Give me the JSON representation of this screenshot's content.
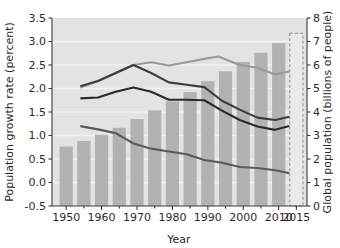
{
  "chart_data": {
    "type": "bar",
    "title": "",
    "subtitle": "",
    "xlabel": "Year",
    "ylabel": "Population growth rate (percent)",
    "y2label": "Global population (billions of people)",
    "xlim": [
      1946,
      2018
    ],
    "ylim": [
      -0.5,
      3.5
    ],
    "y2lim": [
      0,
      8
    ],
    "grid": true,
    "legend": "none",
    "xticks": [
      1950,
      1960,
      1970,
      1980,
      1990,
      2000,
      2010,
      2015
    ],
    "xticklabels": [
      "1950",
      "1960",
      "1970",
      "1980",
      "1990",
      "2000",
      "2010",
      "2015"
    ],
    "xminorticks": [
      1955,
      1965,
      1975,
      1985,
      1995,
      2005
    ],
    "yticks": [
      -0.5,
      0.0,
      0.5,
      1.0,
      1.5,
      2.0,
      2.5,
      3.0,
      3.5
    ],
    "yticklabels": [
      "-0.5",
      "0.0",
      "0.5",
      "1.0",
      "1.5",
      "2.0",
      "2.5",
      "3.0",
      "3.5"
    ],
    "y2ticks": [
      0,
      1,
      2,
      3,
      4,
      5,
      6,
      7,
      8
    ],
    "y2ticklabels": [
      "0",
      "1",
      "2",
      "3",
      "4",
      "5",
      "6",
      "7",
      "8"
    ],
    "bars": {
      "name": "Global population",
      "axis": "right",
      "unit": "billions of people",
      "color": "#b2b2b2",
      "categories": [
        1950,
        1955,
        1960,
        1965,
        1970,
        1975,
        1980,
        1985,
        1990,
        1995,
        2000,
        2005,
        2010,
        2015
      ],
      "values": [
        2.53,
        2.77,
        3.03,
        3.33,
        3.7,
        4.07,
        4.45,
        4.85,
        5.31,
        5.73,
        6.13,
        6.52,
        6.93,
        7.35
      ],
      "projected_index": 13,
      "projected_style": "dashed-outline"
    },
    "series": [
      {
        "name": "upper-light",
        "axis": "left",
        "color": "#9a9a9a",
        "x": [
          1954,
          1959,
          1964,
          1969,
          1974,
          1979,
          1984,
          1989,
          1993,
          1999,
          2004,
          2009,
          2013
        ],
        "values": [
          2.02,
          2.16,
          2.33,
          2.5,
          2.56,
          2.49,
          2.56,
          2.63,
          2.68,
          2.5,
          2.44,
          2.3,
          2.36
        ]
      },
      {
        "name": "upper-dark",
        "axis": "left",
        "color": "#3c3c3c",
        "x": [
          1954,
          1959,
          1964,
          1969,
          1974,
          1979,
          1984,
          1989,
          1994,
          1999,
          2004,
          2009,
          2013
        ],
        "values": [
          2.05,
          2.16,
          2.33,
          2.5,
          2.33,
          2.13,
          2.08,
          2.03,
          1.74,
          1.55,
          1.38,
          1.33,
          1.4
        ]
      },
      {
        "name": "middle-dark",
        "axis": "left",
        "color": "#2a2a2a",
        "x": [
          1954,
          1959,
          1964,
          1969,
          1974,
          1979,
          1984,
          1989,
          1994,
          1999,
          2004,
          2009,
          2013
        ],
        "values": [
          1.79,
          1.81,
          1.93,
          2.02,
          1.93,
          1.76,
          1.76,
          1.75,
          1.53,
          1.33,
          1.19,
          1.12,
          1.2
        ]
      },
      {
        "name": "lower-dark",
        "axis": "left",
        "color": "#5a5a5a",
        "x": [
          1954,
          1959,
          1964,
          1969,
          1974,
          1979,
          1984,
          1989,
          1994,
          1999,
          2004,
          2009,
          2013
        ],
        "values": [
          1.2,
          1.13,
          1.05,
          0.83,
          0.72,
          0.66,
          0.6,
          0.48,
          0.42,
          0.33,
          0.31,
          0.26,
          0.2
        ]
      }
    ]
  },
  "axes": {
    "xlabel": "Year",
    "ylabel": "Population growth rate (percent)",
    "y2label": "Global population (billions of people)"
  }
}
